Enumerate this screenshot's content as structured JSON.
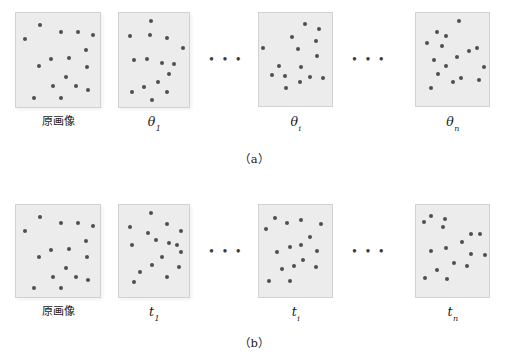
{
  "figure": {
    "background_color": "#ffffff",
    "panel_fill_color": "#ececec",
    "panel_border_color": "#d2d2d2",
    "dot_color": "#4f4f4f",
    "ellipsis_text": "• • •",
    "rows": [
      {
        "id": "row-a",
        "caption": "（a）",
        "panels": [
          {
            "id": "a-original",
            "label_text": "原画像",
            "label_kind": "cjk",
            "symbol": "",
            "subscript": "",
            "x": 15,
            "y": 12,
            "w": 86,
            "h": 96,
            "dots": [
              [
                0.28,
                0.13
              ],
              [
                0.53,
                0.2
              ],
              [
                0.74,
                0.2
              ],
              [
                0.92,
                0.23
              ],
              [
                0.11,
                0.28
              ],
              [
                0.83,
                0.39
              ],
              [
                0.63,
                0.48
              ],
              [
                0.42,
                0.49
              ],
              [
                0.27,
                0.56
              ],
              [
                0.85,
                0.57
              ],
              [
                0.59,
                0.68
              ],
              [
                0.44,
                0.78
              ],
              [
                0.72,
                0.78
              ],
              [
                0.86,
                0.82
              ],
              [
                0.22,
                0.9
              ],
              [
                0.53,
                0.9
              ]
            ]
          },
          {
            "id": "a-theta-1",
            "label_text": "",
            "label_kind": "symbol",
            "symbol": "θ",
            "subscript": "1",
            "x": 118,
            "y": 12,
            "w": 72,
            "h": 96,
            "dots": [
              [
                0.45,
                0.09
              ],
              [
                0.16,
                0.24
              ],
              [
                0.44,
                0.23
              ],
              [
                0.68,
                0.27
              ],
              [
                0.92,
                0.37
              ],
              [
                0.22,
                0.5
              ],
              [
                0.4,
                0.49
              ],
              [
                0.61,
                0.53
              ],
              [
                0.78,
                0.54
              ],
              [
                0.72,
                0.65
              ],
              [
                0.56,
                0.73
              ],
              [
                0.35,
                0.79
              ],
              [
                0.18,
                0.84
              ],
              [
                0.68,
                0.84
              ],
              [
                0.47,
                0.93
              ]
            ]
          },
          {
            "id": "a-theta-i",
            "label_text": "",
            "label_kind": "symbol",
            "symbol": "θ",
            "subscript": "i",
            "x": 258,
            "y": 12,
            "w": 75,
            "h": 95,
            "dots": [
              [
                0.63,
                0.12
              ],
              [
                0.82,
                0.17
              ],
              [
                0.45,
                0.26
              ],
              [
                0.78,
                0.3
              ],
              [
                0.05,
                0.38
              ],
              [
                0.53,
                0.39
              ],
              [
                0.8,
                0.46
              ],
              [
                0.28,
                0.57
              ],
              [
                0.58,
                0.58
              ],
              [
                0.18,
                0.67
              ],
              [
                0.36,
                0.68
              ],
              [
                0.7,
                0.69
              ],
              [
                0.87,
                0.7
              ],
              [
                0.56,
                0.74
              ],
              [
                0.37,
                0.81
              ]
            ]
          },
          {
            "id": "a-theta-n",
            "label_text": "",
            "label_kind": "symbol",
            "symbol": "θ",
            "subscript": "n",
            "x": 415,
            "y": 12,
            "w": 75,
            "h": 95,
            "dots": [
              [
                0.59,
                0.09
              ],
              [
                0.29,
                0.2
              ],
              [
                0.41,
                0.25
              ],
              [
                0.15,
                0.32
              ],
              [
                0.35,
                0.36
              ],
              [
                0.72,
                0.41
              ],
              [
                0.83,
                0.38
              ],
              [
                0.56,
                0.47
              ],
              [
                0.24,
                0.51
              ],
              [
                0.41,
                0.57
              ],
              [
                0.93,
                0.58
              ],
              [
                0.3,
                0.66
              ],
              [
                0.62,
                0.7
              ],
              [
                0.86,
                0.72
              ],
              [
                0.5,
                0.74
              ],
              [
                0.2,
                0.81
              ]
            ]
          }
        ],
        "ellipses": [
          {
            "id": "a-ellipsis-1",
            "x": 209,
            "y": 52
          },
          {
            "id": "a-ellipsis-2",
            "x": 352,
            "y": 52
          }
        ]
      },
      {
        "id": "row-b",
        "caption": "（b）",
        "panels": [
          {
            "id": "b-original",
            "label_text": "原画像",
            "label_kind": "cjk",
            "symbol": "",
            "subscript": "",
            "x": 15,
            "y": 204,
            "w": 86,
            "h": 94,
            "dots": [
              [
                0.28,
                0.13
              ],
              [
                0.53,
                0.2
              ],
              [
                0.74,
                0.2
              ],
              [
                0.92,
                0.23
              ],
              [
                0.11,
                0.28
              ],
              [
                0.83,
                0.39
              ],
              [
                0.63,
                0.48
              ],
              [
                0.42,
                0.49
              ],
              [
                0.27,
                0.56
              ],
              [
                0.85,
                0.57
              ],
              [
                0.59,
                0.68
              ],
              [
                0.44,
                0.78
              ],
              [
                0.72,
                0.78
              ],
              [
                0.86,
                0.82
              ],
              [
                0.22,
                0.9
              ],
              [
                0.53,
                0.9
              ]
            ]
          },
          {
            "id": "b-t-1",
            "label_text": "",
            "label_kind": "symbol",
            "symbol": "t",
            "subscript": "1",
            "x": 118,
            "y": 204,
            "w": 72,
            "h": 94,
            "dots": [
              [
                0.45,
                0.09
              ],
              [
                0.16,
                0.24
              ],
              [
                0.68,
                0.21
              ],
              [
                0.41,
                0.3
              ],
              [
                0.88,
                0.28
              ],
              [
                0.53,
                0.38
              ],
              [
                0.18,
                0.44
              ],
              [
                0.71,
                0.41
              ],
              [
                0.83,
                0.44
              ],
              [
                0.88,
                0.51
              ],
              [
                0.61,
                0.57
              ],
              [
                0.47,
                0.65
              ],
              [
                0.85,
                0.67
              ],
              [
                0.3,
                0.73
              ],
              [
                0.68,
                0.78
              ],
              [
                0.21,
                0.84
              ]
            ]
          },
          {
            "id": "b-t-i",
            "label_text": "",
            "label_kind": "symbol",
            "symbol": "t",
            "subscript": "i",
            "x": 258,
            "y": 204,
            "w": 75,
            "h": 94,
            "dots": [
              [
                0.22,
                0.14
              ],
              [
                0.39,
                0.2
              ],
              [
                0.58,
                0.16
              ],
              [
                0.85,
                0.21
              ],
              [
                0.09,
                0.26
              ],
              [
                0.7,
                0.35
              ],
              [
                0.58,
                0.44
              ],
              [
                0.42,
                0.46
              ],
              [
                0.25,
                0.51
              ],
              [
                0.8,
                0.5
              ],
              [
                0.6,
                0.6
              ],
              [
                0.48,
                0.66
              ],
              [
                0.78,
                0.67
              ],
              [
                0.31,
                0.7
              ],
              [
                0.14,
                0.83
              ],
              [
                0.43,
                0.83
              ]
            ]
          },
          {
            "id": "b-t-n",
            "label_text": "",
            "label_kind": "symbol",
            "symbol": "t",
            "subscript": "n",
            "x": 415,
            "y": 204,
            "w": 75,
            "h": 94,
            "dots": [
              [
                0.2,
                0.12
              ],
              [
                0.4,
                0.15
              ],
              [
                0.11,
                0.19
              ],
              [
                0.37,
                0.24
              ],
              [
                0.76,
                0.31
              ],
              [
                0.88,
                0.31
              ],
              [
                0.63,
                0.4
              ],
              [
                0.41,
                0.47
              ],
              [
                0.2,
                0.5
              ],
              [
                0.76,
                0.53
              ],
              [
                0.94,
                0.54
              ],
              [
                0.52,
                0.63
              ],
              [
                0.7,
                0.66
              ],
              [
                0.29,
                0.71
              ],
              [
                0.12,
                0.79
              ],
              [
                0.43,
                0.8
              ]
            ]
          }
        ],
        "ellipses": [
          {
            "id": "b-ellipsis-1",
            "x": 209,
            "y": 244
          },
          {
            "id": "b-ellipsis-2",
            "x": 352,
            "y": 244
          }
        ]
      }
    ],
    "label_rows": [
      {
        "row": "a",
        "y": 115
      },
      {
        "row": "b",
        "y": 305
      }
    ],
    "caption_positions": [
      {
        "row": "a",
        "y": 150
      },
      {
        "row": "b",
        "y": 334
      }
    ]
  }
}
